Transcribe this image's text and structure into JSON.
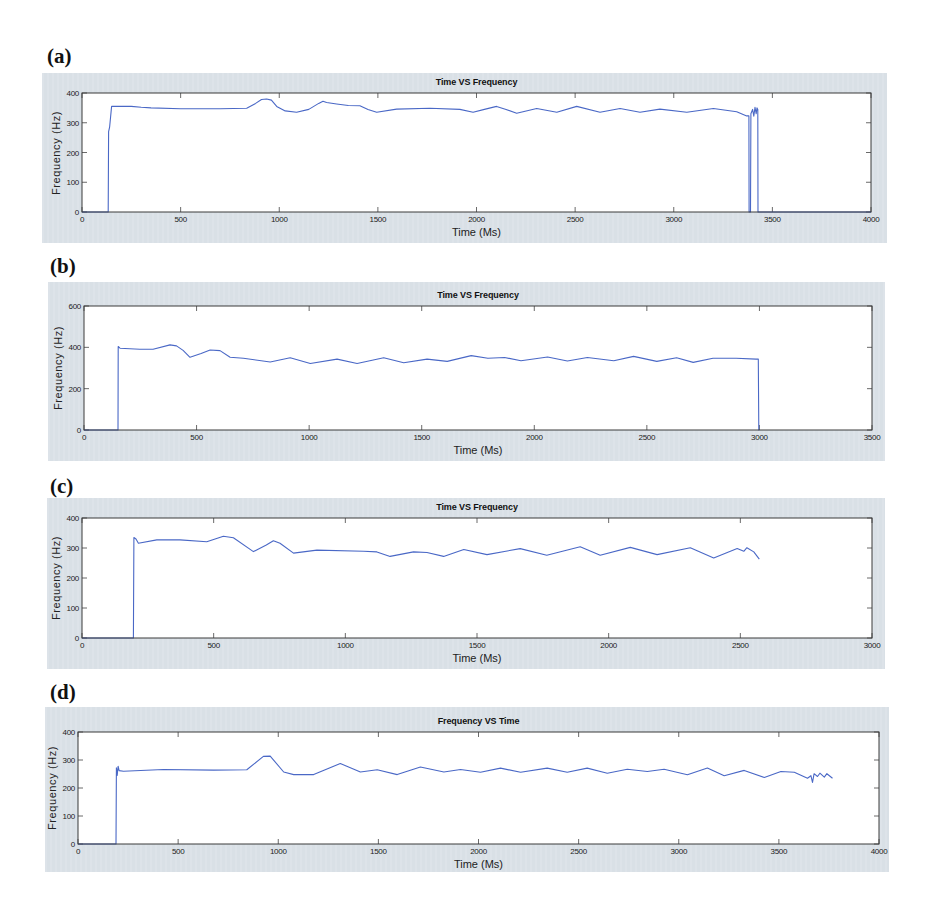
{
  "chart_data": [
    {
      "panel_label": "(a)",
      "type": "line",
      "title": "Time VS Frequency",
      "xlabel": "Time (Ms)",
      "ylabel": "Frequency (Hz)",
      "xlim": [
        0,
        4000
      ],
      "ylim": [
        0,
        400
      ],
      "x_ticks": [
        0,
        500,
        1000,
        1500,
        2000,
        2500,
        3000,
        3500,
        4000
      ],
      "y_ticks": [
        0,
        100,
        200,
        300,
        400
      ],
      "grid": false,
      "legend": null,
      "series": [
        {
          "name": "frequency",
          "color": "#4a68c6",
          "points": [
            [
              0,
              0
            ],
            [
              133,
              0
            ],
            [
              135,
              270
            ],
            [
              140,
              285
            ],
            [
              150,
              355
            ],
            [
              250,
              355
            ],
            [
              300,
              352
            ],
            [
              350,
              350
            ],
            [
              500,
              347
            ],
            [
              700,
              347
            ],
            [
              835,
              349
            ],
            [
              880,
              365
            ],
            [
              910,
              378
            ],
            [
              936,
              380
            ],
            [
              960,
              376
            ],
            [
              987,
              355
            ],
            [
              1030,
              340
            ],
            [
              1088,
              335
            ],
            [
              1150,
              345
            ],
            [
              1200,
              365
            ],
            [
              1222,
              372
            ],
            [
              1240,
              368
            ],
            [
              1291,
              363
            ],
            [
              1350,
              358
            ],
            [
              1409,
              357
            ],
            [
              1450,
              345
            ],
            [
              1494,
              335
            ],
            [
              1595,
              346
            ],
            [
              1764,
              349
            ],
            [
              1916,
              345
            ],
            [
              1983,
              335
            ],
            [
              2040,
              345
            ],
            [
              2102,
              355
            ],
            [
              2150,
              345
            ],
            [
              2204,
              332
            ],
            [
              2305,
              348
            ],
            [
              2407,
              335
            ],
            [
              2508,
              355
            ],
            [
              2626,
              335
            ],
            [
              2728,
              348
            ],
            [
              2829,
              335
            ],
            [
              2930,
              346
            ],
            [
              3066,
              335
            ],
            [
              3201,
              348
            ],
            [
              3319,
              337
            ],
            [
              3370,
              323
            ],
            [
              3381,
              323
            ],
            [
              3382,
              0
            ],
            [
              3389,
              0
            ],
            [
              3391,
              330
            ],
            [
              3400,
              345
            ],
            [
              3406,
              322
            ],
            [
              3412,
              352
            ],
            [
              3418,
              330
            ],
            [
              3422,
              350
            ],
            [
              3426,
              345
            ],
            [
              3427,
              0
            ],
            [
              4000,
              0
            ]
          ]
        }
      ]
    },
    {
      "panel_label": "(b)",
      "type": "line",
      "title": "Time VS Frequency",
      "xlabel": "Time (Ms)",
      "ylabel": "Frequency (Hz)",
      "xlim": [
        0,
        3500
      ],
      "ylim": [
        0,
        600
      ],
      "x_ticks": [
        0,
        500,
        1000,
        1500,
        2000,
        2500,
        3000,
        3500
      ],
      "y_ticks": [
        0,
        200,
        400,
        600
      ],
      "grid": false,
      "legend": null,
      "series": [
        {
          "name": "frequency",
          "color": "#4a68c6",
          "points": [
            [
              0,
              0
            ],
            [
              151,
              0
            ],
            [
              152,
              404
            ],
            [
              160,
              396
            ],
            [
              248,
              391
            ],
            [
              307,
              391
            ],
            [
              382,
              412
            ],
            [
              411,
              407
            ],
            [
              440,
              385
            ],
            [
              471,
              352
            ],
            [
              520,
              370
            ],
            [
              560,
              387
            ],
            [
              604,
              384
            ],
            [
              649,
              352
            ],
            [
              708,
              347
            ],
            [
              827,
              329
            ],
            [
              916,
              350
            ],
            [
              1005,
              322
            ],
            [
              1124,
              343
            ],
            [
              1213,
              322
            ],
            [
              1331,
              350
            ],
            [
              1420,
              325
            ],
            [
              1524,
              343
            ],
            [
              1613,
              332
            ],
            [
              1720,
              360
            ],
            [
              1794,
              347
            ],
            [
              1868,
              351
            ],
            [
              1941,
              335
            ],
            [
              2059,
              353
            ],
            [
              2147,
              334
            ],
            [
              2236,
              351
            ],
            [
              2353,
              335
            ],
            [
              2441,
              356
            ],
            [
              2544,
              332
            ],
            [
              2632,
              350
            ],
            [
              2706,
              327
            ],
            [
              2794,
              347
            ],
            [
              2897,
              347
            ],
            [
              2985,
              343
            ],
            [
              2995,
              343
            ],
            [
              2997,
              0
            ],
            [
              3000,
              0
            ]
          ]
        }
      ]
    },
    {
      "panel_label": "(c)",
      "type": "line",
      "title": "Time VS Frequency",
      "xlabel": "Time (Ms)",
      "ylabel": "Frequency (Hz)",
      "xlim": [
        0,
        3000
      ],
      "ylim": [
        0,
        400
      ],
      "x_ticks": [
        0,
        500,
        1000,
        1500,
        2000,
        2500,
        3000
      ],
      "y_ticks": [
        0,
        100,
        200,
        300,
        400
      ],
      "grid": false,
      "legend": null,
      "series": [
        {
          "name": "frequency",
          "color": "#4a68c6",
          "points": [
            [
              0,
              0
            ],
            [
              195,
              0
            ],
            [
              197,
              335
            ],
            [
              205,
              330
            ],
            [
              214,
              316
            ],
            [
              284,
              327
            ],
            [
              372,
              327
            ],
            [
              474,
              321
            ],
            [
              537,
              339
            ],
            [
              575,
              334
            ],
            [
              651,
              288
            ],
            [
              700,
              310
            ],
            [
              727,
              324
            ],
            [
              752,
              316
            ],
            [
              803,
              283
            ],
            [
              892,
              293
            ],
            [
              1069,
              289
            ],
            [
              1120,
              287
            ],
            [
              1170,
              272
            ],
            [
              1259,
              287
            ],
            [
              1310,
              285
            ],
            [
              1373,
              272
            ],
            [
              1450,
              295
            ],
            [
              1538,
              278
            ],
            [
              1664,
              298
            ],
            [
              1765,
              276
            ],
            [
              1892,
              304
            ],
            [
              1968,
              276
            ],
            [
              2082,
              302
            ],
            [
              2184,
              278
            ],
            [
              2310,
              301
            ],
            [
              2399,
              267
            ],
            [
              2488,
              298
            ],
            [
              2513,
              289
            ],
            [
              2525,
              301
            ],
            [
              2551,
              287
            ],
            [
              2572,
              263
            ]
          ]
        }
      ]
    },
    {
      "panel_label": "(d)",
      "type": "line",
      "title": "Frequency VS Time",
      "xlabel": "Time (Ms)",
      "ylabel": "Frequency (Hz)",
      "xlim": [
        0,
        4000
      ],
      "ylim": [
        0,
        400
      ],
      "x_ticks": [
        0,
        500,
        1000,
        1500,
        2000,
        2500,
        3000,
        3500,
        4000
      ],
      "y_ticks": [
        0,
        100,
        200,
        300,
        400
      ],
      "grid": false,
      "legend": null,
      "series": [
        {
          "name": "frequency",
          "color": "#4a68c6",
          "points": [
            [
              0,
              0
            ],
            [
              190,
              0
            ],
            [
              192,
              272
            ],
            [
              196,
              245
            ],
            [
              200,
              278
            ],
            [
              205,
              262
            ],
            [
              227,
              260
            ],
            [
              427,
              266
            ],
            [
              677,
              264
            ],
            [
              843,
              265
            ],
            [
              926,
              313
            ],
            [
              960,
              314
            ],
            [
              1027,
              257
            ],
            [
              1077,
              248
            ],
            [
              1177,
              248
            ],
            [
              1310,
              287
            ],
            [
              1410,
              257
            ],
            [
              1494,
              265
            ],
            [
              1594,
              248
            ],
            [
              1710,
              275
            ],
            [
              1827,
              257
            ],
            [
              1910,
              266
            ],
            [
              2010,
              256
            ],
            [
              2110,
              271
            ],
            [
              2210,
              256
            ],
            [
              2343,
              271
            ],
            [
              2443,
              256
            ],
            [
              2543,
              271
            ],
            [
              2643,
              253
            ],
            [
              2743,
              267
            ],
            [
              2843,
              259
            ],
            [
              2927,
              267
            ],
            [
              3043,
              247
            ],
            [
              3143,
              271
            ],
            [
              3227,
              244
            ],
            [
              3327,
              263
            ],
            [
              3427,
              238
            ],
            [
              3510,
              259
            ],
            [
              3577,
              256
            ],
            [
              3643,
              235
            ],
            [
              3660,
              244
            ],
            [
              3668,
              220
            ],
            [
              3676,
              251
            ],
            [
              3693,
              241
            ],
            [
              3705,
              253
            ],
            [
              3727,
              239
            ],
            [
              3740,
              251
            ],
            [
              3768,
              235
            ]
          ]
        }
      ]
    }
  ]
}
